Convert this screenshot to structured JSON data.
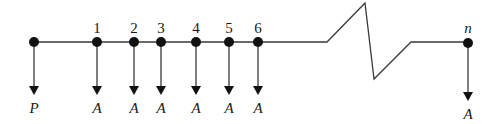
{
  "diagram": {
    "type": "cash-flow-timeline",
    "colors": {
      "line": "#3a3a3a",
      "node": "#111111",
      "text": "#1a1a1a"
    },
    "timeline": {
      "y": 42,
      "start_x": 34,
      "break": {
        "left_x": 327,
        "peak": [
          365,
          3
        ],
        "trough": [
          374,
          79
        ],
        "right_x": 411
      },
      "end_x": 468
    },
    "nodes": [
      {
        "x": 34,
        "period_label": "",
        "flow_label": "P",
        "arrow_end_y": 93,
        "label_y": 111
      },
      {
        "x": 97,
        "period_label": "1",
        "flow_label": "A",
        "arrow_end_y": 93,
        "label_y": 111
      },
      {
        "x": 134,
        "period_label": "2",
        "flow_label": "A",
        "arrow_end_y": 93,
        "label_y": 111
      },
      {
        "x": 161,
        "period_label": "3",
        "flow_label": "A",
        "arrow_end_y": 93,
        "label_y": 111
      },
      {
        "x": 196,
        "period_label": "4",
        "flow_label": "A",
        "arrow_end_y": 93,
        "label_y": 111
      },
      {
        "x": 229,
        "period_label": "5",
        "flow_label": "A",
        "arrow_end_y": 93,
        "label_y": 111
      },
      {
        "x": 258,
        "period_label": "6",
        "flow_label": "A",
        "arrow_end_y": 93,
        "label_y": 111
      },
      {
        "x": 468,
        "period_label": "n",
        "flow_label": "A",
        "arrow_end_y": 100,
        "label_y": 117
      }
    ]
  }
}
